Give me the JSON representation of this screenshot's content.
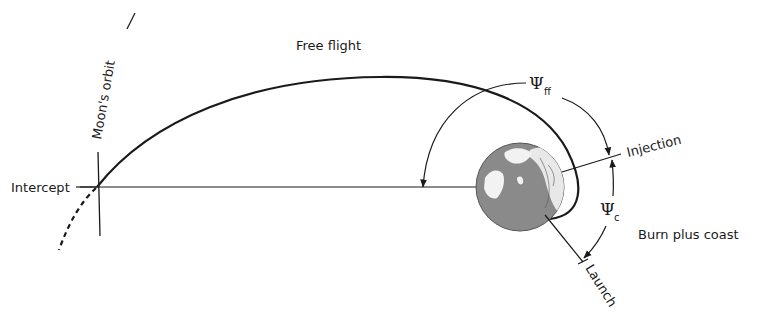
{
  "diagram": {
    "labels": {
      "free_flight": "Free flight",
      "moons_orbit": "Moon's orbit",
      "intercept": "Intercept",
      "injection": "Injection",
      "launch": "Launch",
      "burn_plus_coast": "Burn plus coast",
      "psi_ff_symbol": "Ψ",
      "psi_ff_subscript": "ff",
      "psi_c_symbol": "Ψ",
      "psi_c_subscript": "c"
    },
    "colors": {
      "line": "#1a1a1a",
      "earth_ocean": "#8a8a8a",
      "earth_land": "#f2f2f2",
      "background": "#ffffff"
    }
  }
}
